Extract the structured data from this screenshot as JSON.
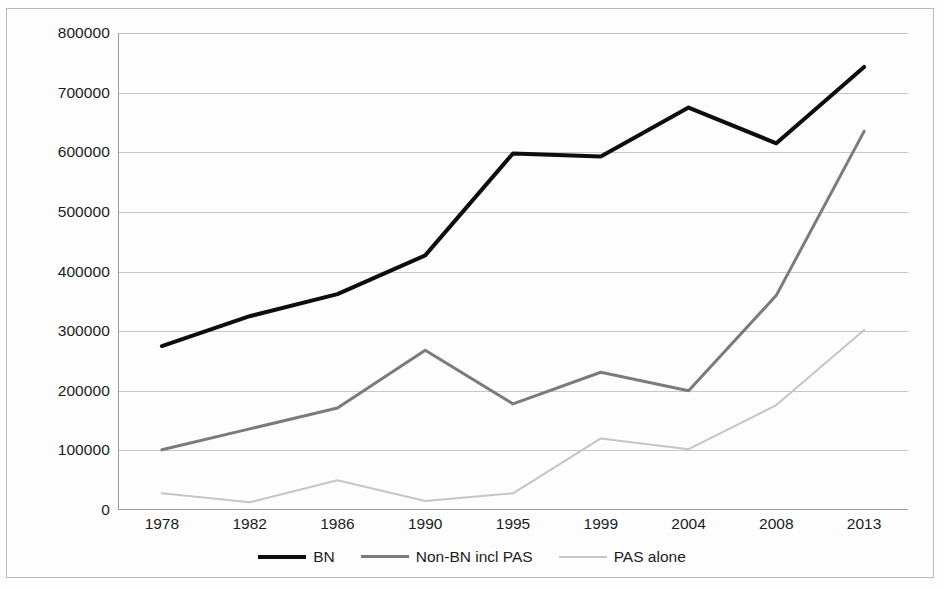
{
  "chart_data": {
    "type": "line",
    "title": "",
    "xlabel": "",
    "ylabel": "",
    "categories": [
      "1978",
      "1982",
      "1986",
      "1990",
      "1995",
      "1999",
      "2004",
      "2008",
      "2013"
    ],
    "ylim": [
      0,
      800000
    ],
    "ytick_labels": [
      "800000",
      "700000",
      "600000",
      "500000",
      "400000",
      "300000",
      "200000",
      "100000",
      "0"
    ],
    "ytick_values": [
      800000,
      700000,
      600000,
      500000,
      400000,
      300000,
      200000,
      100000,
      0
    ],
    "ytick_step": 100000,
    "grid": "horizontal",
    "legend_position": "bottom",
    "series": [
      {
        "name": "BN",
        "color": "#0d0d0d",
        "width": 4,
        "values": [
          275000,
          325000,
          362000,
          427000,
          598000,
          593000,
          675000,
          615000,
          743000
        ]
      },
      {
        "name": "Non-BN incl PAS",
        "color": "#7b7b7b",
        "width": 3,
        "values": [
          101000,
          136000,
          171000,
          268000,
          178000,
          231000,
          200000,
          360000,
          635000
        ]
      },
      {
        "name": "PAS alone",
        "color": "#c5c5c5",
        "width": 2,
        "values": [
          28000,
          13000,
          50000,
          15000,
          28000,
          120000,
          102000,
          176000,
          302000
        ]
      }
    ]
  },
  "legend": {
    "items": [
      {
        "label": "BN"
      },
      {
        "label": "Non-BN incl PAS"
      },
      {
        "label": "PAS alone"
      }
    ]
  }
}
